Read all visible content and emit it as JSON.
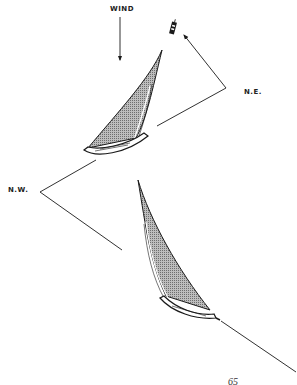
{
  "diagram": {
    "type": "sailing-tack-diagram",
    "labels": {
      "wind": "WIND",
      "north_east": "N.E.",
      "north_west": "N.W.",
      "page_number": "65"
    },
    "elements": [
      {
        "name": "wind-arrow",
        "direction": "down"
      },
      {
        "name": "mark-buoy",
        "description": "small dark buoy/marker at top"
      },
      {
        "name": "boat-upper",
        "tack": "N.E.",
        "sail": "stippled gray"
      },
      {
        "name": "boat-lower",
        "tack": "N.W.",
        "sail": "stippled gray"
      },
      {
        "name": "course-line-ne",
        "points": [
          [
            157,
            126
          ],
          [
            226,
            88
          ],
          [
            182,
            33
          ]
        ],
        "arrowhead": "end"
      },
      {
        "name": "course-line-nw",
        "points": [
          [
            96,
            160
          ],
          [
            40,
            192
          ],
          [
            122,
            250
          ]
        ]
      },
      {
        "name": "course-line-start",
        "points": [
          [
            221,
            321
          ],
          [
            296,
            372
          ]
        ]
      }
    ],
    "colors": {
      "ink": "#1a1a1a",
      "sail_fill": "#9a9a9a",
      "background": "#ffffff"
    }
  }
}
